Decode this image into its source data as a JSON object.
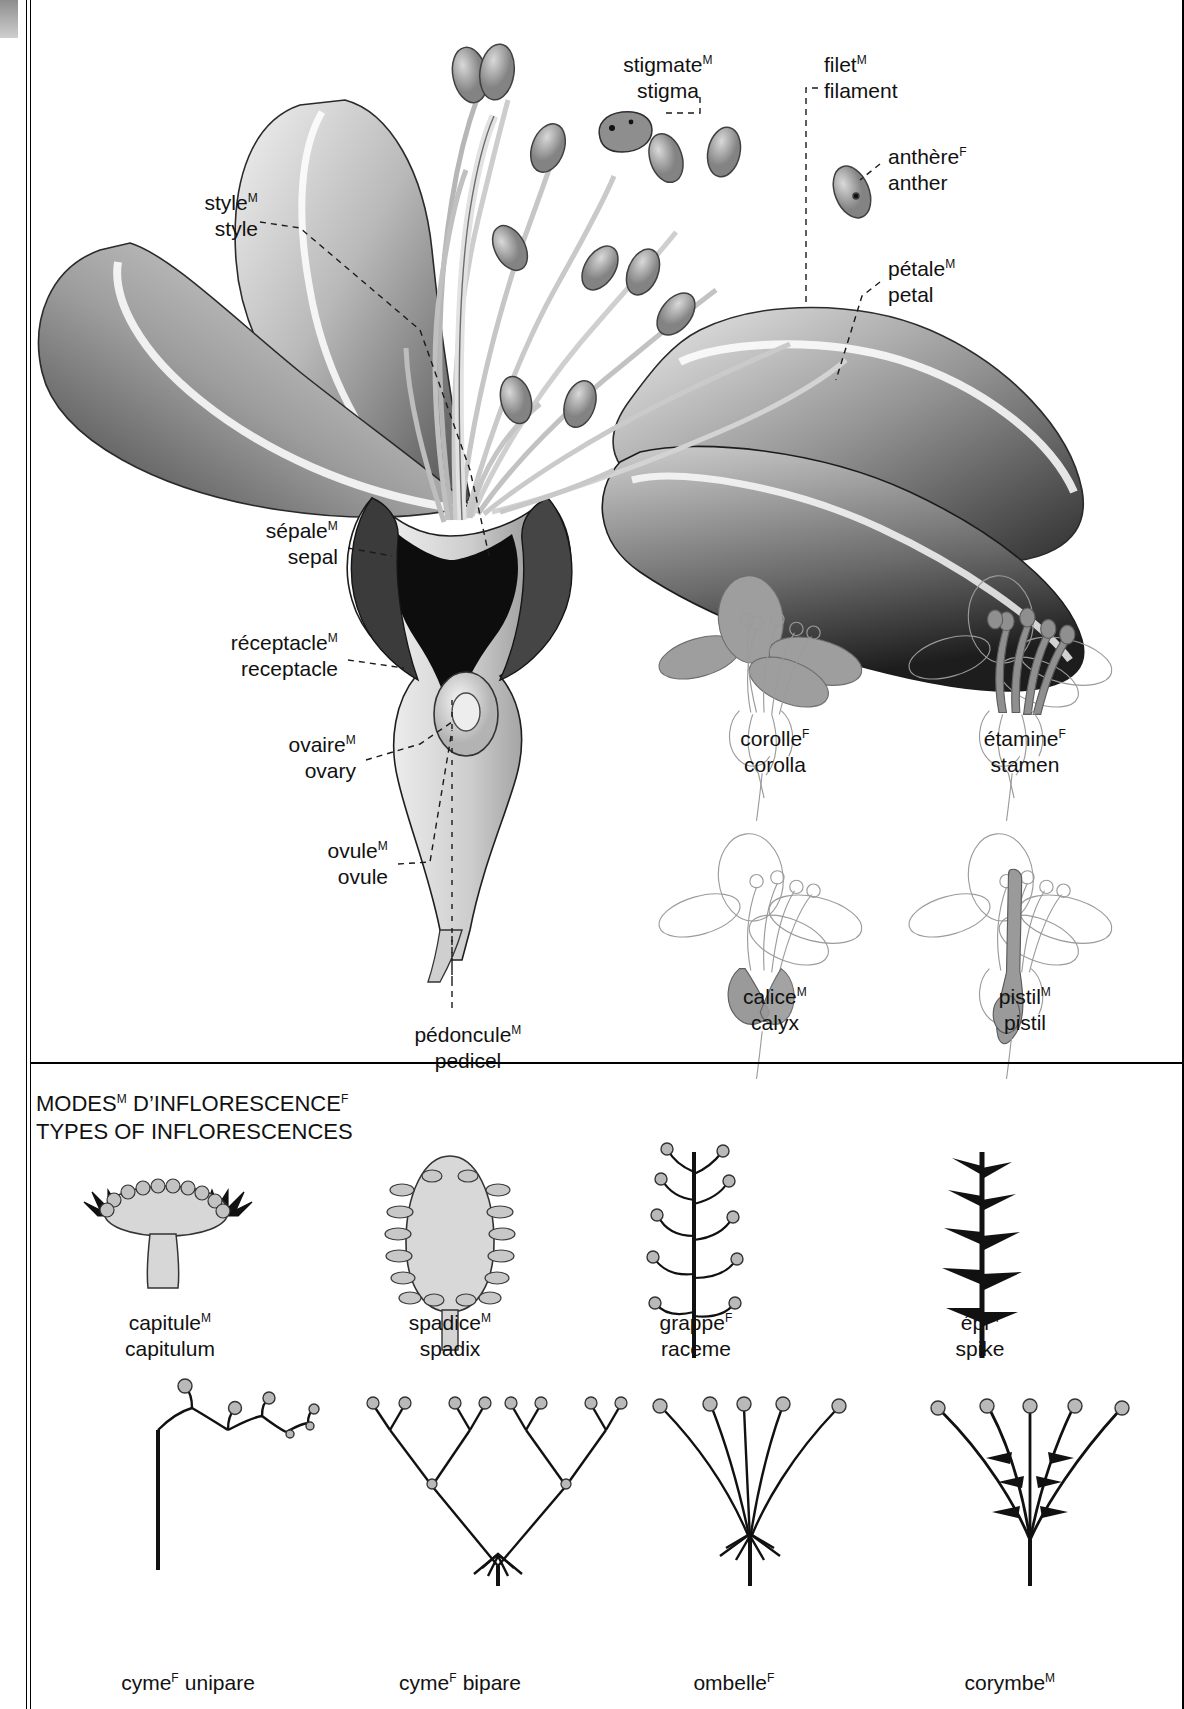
{
  "spine": {
    "section_title": "VEGETABLE KINGDOM"
  },
  "main_figure": {
    "name": "flower-cross-section",
    "labels": [
      {
        "id": "stigma",
        "fr": "stigmate",
        "fr_gender": "M",
        "en": "stigma"
      },
      {
        "id": "filament",
        "fr": "filet",
        "fr_gender": "M",
        "en": "filament"
      },
      {
        "id": "anther",
        "fr": "anthère",
        "fr_gender": "F",
        "en": "anther"
      },
      {
        "id": "petal",
        "fr": "pétale",
        "fr_gender": "M",
        "en": "petal"
      },
      {
        "id": "style",
        "fr": "style",
        "fr_gender": "M",
        "en": "style"
      },
      {
        "id": "sepal",
        "fr": "sépale",
        "fr_gender": "M",
        "en": "sepal"
      },
      {
        "id": "receptacle",
        "fr": "réceptacle",
        "fr_gender": "M",
        "en": "receptacle"
      },
      {
        "id": "ovary",
        "fr": "ovaire",
        "fr_gender": "M",
        "en": "ovary"
      },
      {
        "id": "ovule",
        "fr": "ovule",
        "fr_gender": "M",
        "en": "ovule"
      },
      {
        "id": "pedicel",
        "fr": "pédoncule",
        "fr_gender": "M",
        "en": "pedicel"
      }
    ]
  },
  "detail_figures": [
    {
      "id": "corolla",
      "fr": "corolle",
      "fr_gender": "F",
      "en": "corolla",
      "highlight": "petals"
    },
    {
      "id": "stamen",
      "fr": "étamine",
      "fr_gender": "F",
      "en": "stamen",
      "highlight": "stamens"
    },
    {
      "id": "calyx",
      "fr": "calice",
      "fr_gender": "M",
      "en": "calyx",
      "highlight": "sepals"
    },
    {
      "id": "pistil",
      "fr": "pistil",
      "fr_gender": "M",
      "en": "pistil",
      "highlight": "pistil"
    }
  ],
  "inflorescence_section": {
    "heading_fr": "MODES",
    "heading_fr_gender": "M",
    "heading_fr_2": " D’INFLORESCENCE",
    "heading_fr_2_gender": "F",
    "heading_en": "TYPES OF INFLORESCENCES",
    "items": [
      {
        "id": "capitulum",
        "fr": "capitule",
        "fr_gender": "M",
        "en": "capitulum"
      },
      {
        "id": "spadix",
        "fr": "spadice",
        "fr_gender": "M",
        "en": "spadix"
      },
      {
        "id": "raceme",
        "fr": "grappe",
        "fr_gender": "F",
        "en": "raceme"
      },
      {
        "id": "spike",
        "fr": "épi",
        "fr_gender": "M",
        "en": "spike"
      },
      {
        "id": "cyme-unipare",
        "fr": "cyme",
        "fr_gender": "F",
        "en": "",
        "fr_suffix": " unipare"
      },
      {
        "id": "cyme-bipare",
        "fr": "cyme",
        "fr_gender": "F",
        "en": "",
        "fr_suffix": " bipare"
      },
      {
        "id": "umbel",
        "fr": "ombelle",
        "fr_gender": "F",
        "en": ""
      },
      {
        "id": "corymb",
        "fr": "corymbe",
        "fr_gender": "M",
        "en": ""
      }
    ]
  },
  "colors": {
    "ink": "#111111",
    "petal_dark": "#3a3a3a",
    "petal_mid": "#8a8a8a",
    "petal_light": "#cfcfcf",
    "highlight_gray": "#9a9a9a",
    "outline_gray": "#9b9b9b",
    "background": "#ffffff"
  }
}
